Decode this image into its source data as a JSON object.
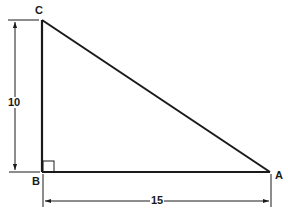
{
  "diagram": {
    "type": "right-triangle",
    "colors": {
      "stroke": "#1a1a1a",
      "background": "#ffffff"
    },
    "vertices": [
      {
        "id": "C",
        "label": "C"
      },
      {
        "id": "B",
        "label": "B"
      },
      {
        "id": "A",
        "label": "A"
      }
    ],
    "right_angle_at": "B",
    "dimensions": {
      "vertical": {
        "from": "B",
        "to": "C",
        "label": "10"
      },
      "horizontal": {
        "from": "B",
        "to": "A",
        "label": "15"
      }
    }
  }
}
